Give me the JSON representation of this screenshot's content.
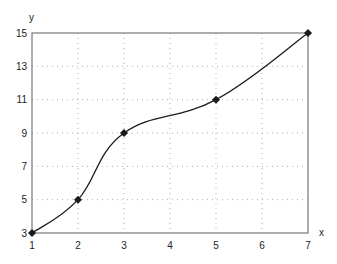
{
  "chart_data": {
    "type": "line",
    "title": "",
    "xlabel": "x",
    "ylabel": "y",
    "x": [
      1,
      2,
      3,
      5,
      7
    ],
    "series": [
      {
        "name": "y",
        "values": [
          3,
          5,
          9,
          11,
          15
        ],
        "color": "#1a1a1a",
        "marker": "diamond",
        "smooth": true
      }
    ],
    "xlim": [
      1,
      7
    ],
    "ylim": [
      3,
      15
    ],
    "xticks": [
      1,
      2,
      3,
      4,
      5,
      6,
      7
    ],
    "yticks": [
      3,
      5,
      7,
      9,
      11,
      13,
      15
    ],
    "grid": true,
    "grid_style": "dotted",
    "legend": null
  },
  "colors": {
    "axis": "#777777",
    "grid": "#b0b0b0",
    "line": "#1a1a1a"
  }
}
